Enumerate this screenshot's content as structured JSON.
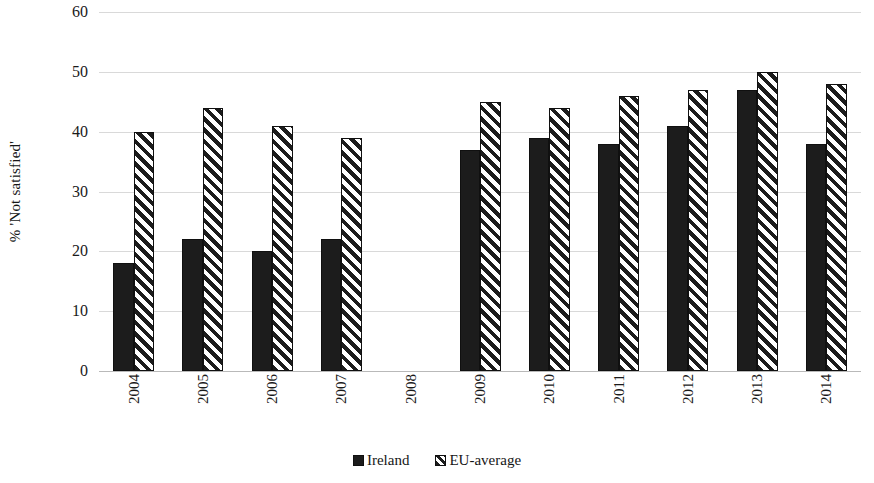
{
  "chart_data": {
    "type": "bar",
    "title": "",
    "subtitle": "",
    "xlabel": "",
    "ylabel": "% 'Not satisfied'",
    "categories": [
      "2004",
      "2005",
      "2006",
      "2007",
      "2008",
      "2009",
      "2010",
      "2011",
      "2012",
      "2013",
      "2014"
    ],
    "series": [
      {
        "name": "Ireland",
        "color": "#1c1c1c",
        "fill": "solid",
        "values": [
          18,
          22,
          20,
          22,
          null,
          37,
          39,
          38,
          41,
          47,
          38
        ]
      },
      {
        "name": "EU-average",
        "color": "#1c1c1c",
        "fill": "diagonal-hatch",
        "values": [
          40,
          44,
          41,
          39,
          null,
          45,
          44,
          46,
          47,
          50,
          48
        ]
      }
    ],
    "ylim": [
      0,
      60
    ],
    "ytick_labels": [
      "0",
      "10",
      "20",
      "30",
      "40",
      "50",
      "60"
    ],
    "ytick_values": [
      0,
      10,
      20,
      30,
      40,
      50,
      60
    ],
    "grid": "horizontal",
    "legend_position": "bottom"
  },
  "legend": {
    "items": [
      {
        "label": "Ireland",
        "fill": "solid"
      },
      {
        "label": "EU-average",
        "fill": "diagonal-hatch"
      }
    ]
  }
}
